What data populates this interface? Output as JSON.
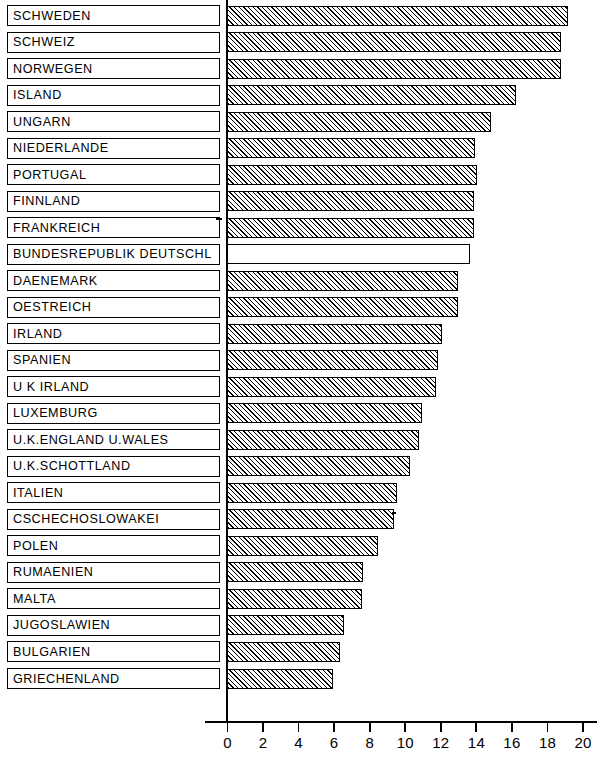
{
  "chart_data": {
    "type": "bar",
    "orientation": "horizontal",
    "title": "",
    "subtitle": "",
    "xlabel": "",
    "ylabel": "",
    "xlim": [
      0,
      20
    ],
    "xticks": [
      0,
      2,
      4,
      6,
      8,
      10,
      12,
      14,
      16,
      18,
      20
    ],
    "xtick_labels": [
      "0",
      "2",
      "4",
      "6",
      "8",
      "10",
      "12",
      "14",
      "16",
      "18",
      "20"
    ],
    "grid": false,
    "legend": null,
    "categories": [
      "SCHWEDEN",
      "SCHWEIZ",
      "NORWEGEN",
      "ISLAND",
      "UNGARN",
      "NIEDERLANDE",
      "PORTUGAL",
      "FINNLAND",
      "FRANKREICH",
      "BUNDESREPUBLIK DEUTSCHL",
      "DAENEMARK",
      "OESTREICH",
      "IRLAND",
      "SPANIEN",
      "U K IRLAND",
      "LUXEMBURG",
      "U.K.ENGLAND U.WALES",
      "U.K.SCHOTTLAND",
      "ITALIEN",
      "CSCHECHOSLOWAKEI",
      "POLEN",
      "RUMAENIEN",
      "MALTA",
      "JUGOSLAWIEN",
      "BULGARIEN",
      "GRIECHENLAND"
    ],
    "values": [
      19.2,
      18.8,
      18.8,
      16.3,
      14.9,
      14.0,
      14.1,
      13.9,
      13.9,
      13.7,
      13.0,
      13.0,
      12.1,
      11.9,
      11.8,
      11.0,
      10.8,
      10.3,
      9.6,
      9.4,
      8.5,
      7.7,
      7.6,
      6.6,
      6.4,
      6.0
    ],
    "highlighted_category": "BUNDESREPUBLIK DEUTSCHL",
    "bar_styles": [
      "hatched",
      "hatched",
      "hatched",
      "hatched",
      "hatched",
      "hatched",
      "hatched",
      "hatched",
      "hatched",
      "plain",
      "hatched",
      "hatched",
      "hatched",
      "hatched",
      "hatched",
      "hatched",
      "hatched",
      "hatched",
      "hatched",
      "hatched",
      "hatched",
      "hatched",
      "hatched",
      "hatched",
      "hatched",
      "hatched"
    ],
    "colors": {
      "bar_fill": "#ffffff",
      "bar_hatch": "#000000",
      "bar_outline": "#000000",
      "axis": "#000000",
      "text": "#000000",
      "background": "#ffffff"
    }
  }
}
